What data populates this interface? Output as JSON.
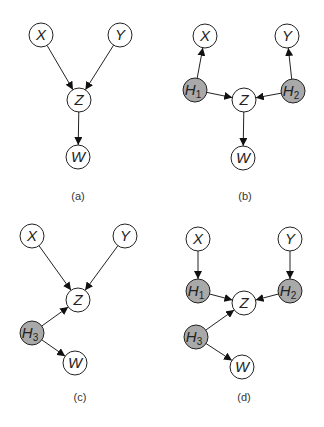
{
  "colors": {
    "observed_fill": "#ffffff",
    "hidden_fill": "#a9a9a9",
    "stroke": "#222222"
  },
  "node_radius": 12,
  "panels": [
    {
      "id": "a",
      "caption": "(a)",
      "caption_pos": [
        78,
        200
      ],
      "nodes": [
        {
          "id": "X",
          "label": "X",
          "sub": "",
          "x": 41,
          "y": 35,
          "hidden": false
        },
        {
          "id": "Y",
          "label": "Y",
          "sub": "",
          "x": 120,
          "y": 35,
          "hidden": false
        },
        {
          "id": "Z",
          "label": "Z",
          "sub": "",
          "x": 79,
          "y": 100,
          "hidden": false
        },
        {
          "id": "W",
          "label": "W",
          "sub": "",
          "x": 78,
          "y": 157,
          "hidden": false
        }
      ],
      "edges": [
        [
          "X",
          "Z"
        ],
        [
          "Y",
          "Z"
        ],
        [
          "Z",
          "W"
        ]
      ]
    },
    {
      "id": "b",
      "caption": "(b)",
      "caption_pos": [
        245,
        200
      ],
      "nodes": [
        {
          "id": "X",
          "label": "X",
          "sub": "",
          "x": 205,
          "y": 36,
          "hidden": false
        },
        {
          "id": "Y",
          "label": "Y",
          "sub": "",
          "x": 287,
          "y": 36,
          "hidden": false
        },
        {
          "id": "H1",
          "label": "H",
          "sub": "1",
          "x": 195,
          "y": 90,
          "hidden": true
        },
        {
          "id": "H2",
          "label": "H",
          "sub": "2",
          "x": 293,
          "y": 91,
          "hidden": true
        },
        {
          "id": "Z",
          "label": "Z",
          "sub": "",
          "x": 244,
          "y": 100,
          "hidden": false
        },
        {
          "id": "W",
          "label": "W",
          "sub": "",
          "x": 243,
          "y": 158,
          "hidden": false
        }
      ],
      "edges": [
        [
          "H1",
          "X"
        ],
        [
          "H2",
          "Y"
        ],
        [
          "H1",
          "Z"
        ],
        [
          "H2",
          "Z"
        ],
        [
          "Z",
          "W"
        ]
      ]
    },
    {
      "id": "c",
      "caption": "(c)",
      "caption_pos": [
        80,
        401
      ],
      "nodes": [
        {
          "id": "X",
          "label": "X",
          "sub": "",
          "x": 32,
          "y": 236,
          "hidden": false
        },
        {
          "id": "Y",
          "label": "Y",
          "sub": "",
          "x": 125,
          "y": 236,
          "hidden": false
        },
        {
          "id": "Z",
          "label": "Z",
          "sub": "",
          "x": 78,
          "y": 300,
          "hidden": false
        },
        {
          "id": "H3",
          "label": "H",
          "sub": "3",
          "x": 32,
          "y": 333,
          "hidden": true
        },
        {
          "id": "W",
          "label": "W",
          "sub": "",
          "x": 75,
          "y": 363,
          "hidden": false
        }
      ],
      "edges": [
        [
          "X",
          "Z"
        ],
        [
          "Y",
          "Z"
        ],
        [
          "H3",
          "Z"
        ],
        [
          "H3",
          "W"
        ]
      ]
    },
    {
      "id": "d",
      "caption": "(d)",
      "caption_pos": [
        244,
        401
      ],
      "nodes": [
        {
          "id": "X",
          "label": "X",
          "sub": "",
          "x": 198,
          "y": 239,
          "hidden": false
        },
        {
          "id": "Y",
          "label": "Y",
          "sub": "",
          "x": 290,
          "y": 239,
          "hidden": false
        },
        {
          "id": "H1",
          "label": "H",
          "sub": "1",
          "x": 198,
          "y": 291,
          "hidden": true
        },
        {
          "id": "H2",
          "label": "H",
          "sub": "2",
          "x": 290,
          "y": 291,
          "hidden": true
        },
        {
          "id": "Z",
          "label": "Z",
          "sub": "",
          "x": 244,
          "y": 303,
          "hidden": false
        },
        {
          "id": "H3",
          "label": "H",
          "sub": "3",
          "x": 196,
          "y": 337,
          "hidden": true
        },
        {
          "id": "W",
          "label": "W",
          "sub": "",
          "x": 242,
          "y": 367,
          "hidden": false
        }
      ],
      "edges": [
        [
          "X",
          "H1"
        ],
        [
          "Y",
          "H2"
        ],
        [
          "H1",
          "Z"
        ],
        [
          "H2",
          "Z"
        ],
        [
          "H3",
          "Z"
        ],
        [
          "H3",
          "W"
        ]
      ]
    }
  ]
}
